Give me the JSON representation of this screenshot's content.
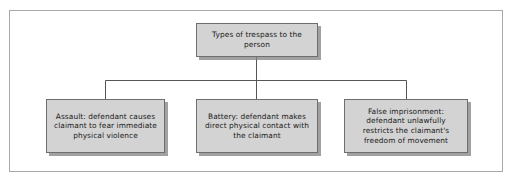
{
  "diagram": {
    "type": "flowchart",
    "orientation": "top-down",
    "frame": {
      "border_color": "#a8a8a8",
      "background_color": "#ffffff"
    },
    "style": {
      "node_fill": "#d3d3d3",
      "node_border": "#6e6e6e",
      "node_shadow": "#828282",
      "connector_color": "#555555",
      "text_color": "#1a1a1a"
    },
    "root": {
      "id": "types-of-trespass-to-the-person",
      "label": "Types of trespass to the person"
    },
    "children": [
      {
        "id": "assault",
        "label": "Assault: defendant causes claimant to fear immediate physical violence"
      },
      {
        "id": "battery",
        "label": "Battery: defendant makes direct physical contact with the claimant"
      },
      {
        "id": "false-imprisonment",
        "label": "False imprisonment: defendant unlawfully restricts the claimant's freedom of movement"
      }
    ]
  }
}
